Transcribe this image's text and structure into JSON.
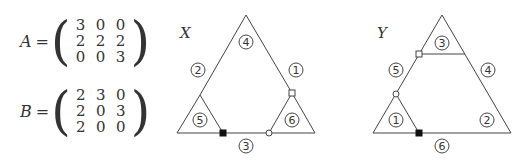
{
  "matrices": [
    {
      "name": "A",
      "rows": [
        [
          "3",
          "0",
          "0"
        ],
        [
          "2",
          "2",
          "2"
        ],
        [
          "0",
          "0",
          "3"
        ]
      ]
    },
    {
      "name": "B",
      "rows": [
        [
          "2",
          "3",
          "0"
        ],
        [
          "2",
          "0",
          "3"
        ],
        [
          "2",
          "0",
          "0"
        ]
      ]
    }
  ],
  "equals": "=",
  "diagrams": [
    {
      "title": "X",
      "labels": [
        {
          "id": "x-region-4",
          "text": "4",
          "x": 246,
          "y": 42
        },
        {
          "id": "x-region-2",
          "text": "2",
          "x": 198,
          "y": 70
        },
        {
          "id": "x-region-1",
          "text": "1",
          "x": 296,
          "y": 70
        },
        {
          "id": "x-region-5",
          "text": "5",
          "x": 200,
          "y": 120
        },
        {
          "id": "x-region-6",
          "text": "6",
          "x": 292,
          "y": 120
        },
        {
          "id": "x-region-3",
          "text": "3",
          "x": 246,
          "y": 146
        }
      ]
    },
    {
      "title": "Y",
      "labels": [
        {
          "id": "y-region-3",
          "text": "3",
          "x": 442,
          "y": 43
        },
        {
          "id": "y-region-5",
          "text": "5",
          "x": 396,
          "y": 70
        },
        {
          "id": "y-region-4",
          "text": "4",
          "x": 488,
          "y": 70
        },
        {
          "id": "y-region-1",
          "text": "1",
          "x": 396,
          "y": 120
        },
        {
          "id": "y-region-2",
          "text": "2",
          "x": 487,
          "y": 120
        },
        {
          "id": "y-region-6",
          "text": "6",
          "x": 442,
          "y": 146
        }
      ]
    }
  ]
}
